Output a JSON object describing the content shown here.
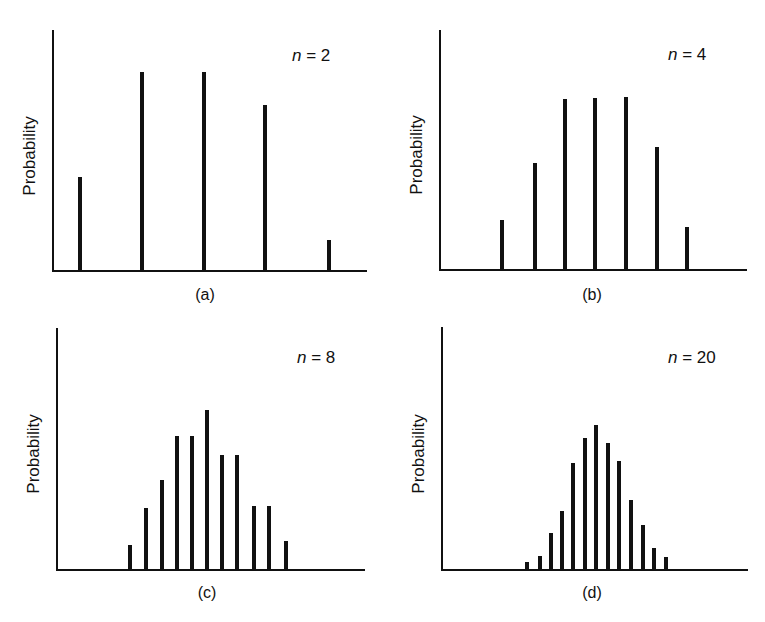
{
  "figure": {
    "ylabel": "Probability",
    "panels": [
      {
        "id": "a",
        "sublabel": "(a)",
        "n_var": "n",
        "n_eq": " = 2"
      },
      {
        "id": "b",
        "sublabel": "(b)",
        "n_var": "n",
        "n_eq": " = 4"
      },
      {
        "id": "c",
        "sublabel": "(c)",
        "n_var": "n",
        "n_eq": " = 8"
      },
      {
        "id": "d",
        "sublabel": "(d)",
        "n_var": "n",
        "n_eq": " = 20"
      }
    ]
  },
  "chart_data": [
    {
      "type": "bar",
      "title": "n = 2",
      "panel": "(a)",
      "xlabel": "",
      "ylabel": "Probability",
      "categories": [
        1,
        2,
        3,
        4,
        5
      ],
      "values": [
        94,
        199,
        199,
        166,
        31
      ],
      "value_units": "relative height (px, no numeric axis shown)",
      "grid": false,
      "ticks": "none"
    },
    {
      "type": "bar",
      "title": "n = 4",
      "panel": "(b)",
      "xlabel": "",
      "ylabel": "Probability",
      "categories": [
        1,
        2,
        3,
        4,
        5,
        6,
        7
      ],
      "values": [
        50,
        107,
        171,
        172,
        173,
        123,
        43
      ],
      "value_units": "relative height (px, no numeric axis shown)",
      "grid": false,
      "ticks": "none"
    },
    {
      "type": "bar",
      "title": "n = 8",
      "panel": "(c)",
      "xlabel": "",
      "ylabel": "Probability",
      "categories": [
        1,
        2,
        3,
        4,
        5,
        6,
        7,
        8,
        9,
        10,
        11
      ],
      "values": [
        25,
        62,
        90,
        134,
        134,
        160,
        115,
        115,
        64,
        64,
        29
      ],
      "value_units": "relative height (px, no numeric axis shown)",
      "grid": false,
      "ticks": "none"
    },
    {
      "type": "bar",
      "title": "n = 20",
      "panel": "(d)",
      "xlabel": "",
      "ylabel": "Probability",
      "categories": [
        1,
        2,
        3,
        4,
        5,
        6,
        7,
        8,
        9,
        10,
        11,
        12,
        13
      ],
      "values": [
        8,
        14,
        37,
        59,
        107,
        132,
        145,
        127,
        109,
        70,
        45,
        22,
        13
      ],
      "value_units": "relative height (px, no numeric axis shown)",
      "grid": false,
      "ticks": "none"
    }
  ],
  "layout": {
    "panels": [
      {
        "axis_left": 53,
        "axis_top": 30,
        "baseline": 271,
        "axis_right": 367,
        "bar_x": [
          80,
          142,
          204,
          265,
          329
        ]
      },
      {
        "axis_left": 440,
        "axis_top": 30,
        "baseline": 270,
        "axis_right": 747,
        "bar_x": [
          502,
          535,
          565,
          595,
          626,
          657,
          687
        ]
      },
      {
        "axis_left": 57,
        "axis_top": 328,
        "baseline": 570,
        "axis_right": 365,
        "bar_x": [
          130,
          146,
          162,
          177,
          192,
          207,
          222,
          237,
          254,
          269,
          286
        ]
      },
      {
        "axis_left": 442,
        "axis_top": 327,
        "baseline": 570,
        "axis_right": 748,
        "bar_x": [
          527,
          540,
          551,
          562,
          573,
          585,
          596,
          608,
          619,
          631,
          643,
          654,
          666
        ]
      }
    ]
  }
}
